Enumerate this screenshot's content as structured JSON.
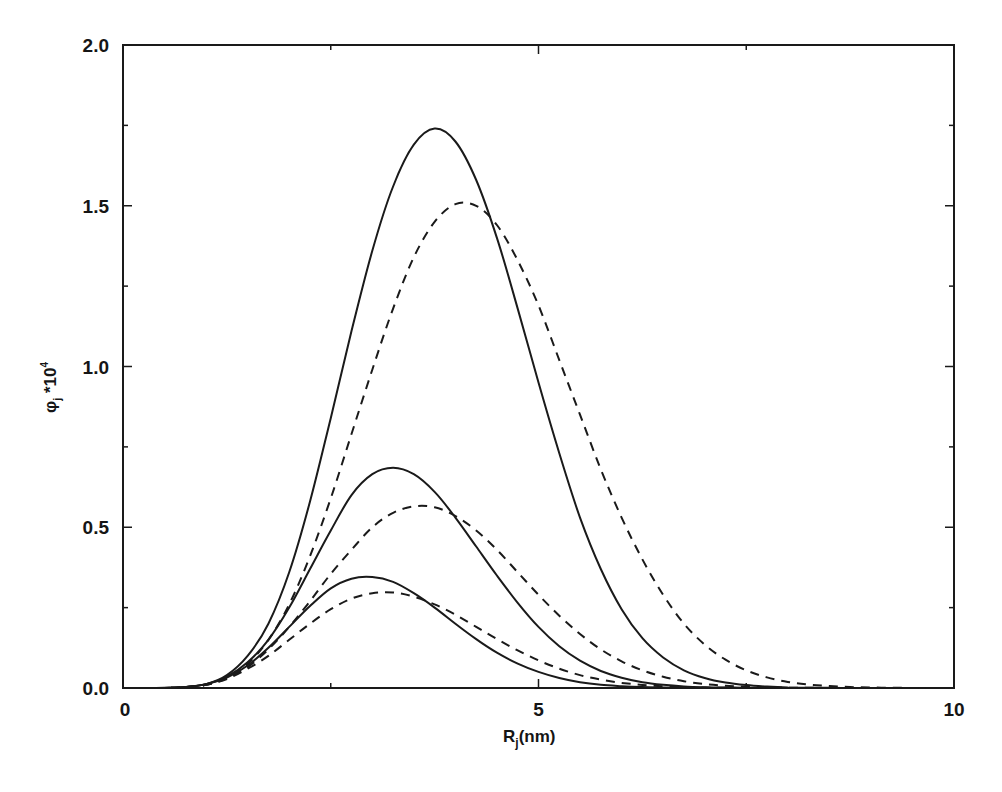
{
  "chart_data": {
    "type": "line",
    "title": "",
    "xlabel": "R_j(nm)",
    "ylabel": "φ_j *10^4",
    "xlim": [
      0,
      10
    ],
    "ylim": [
      0,
      2.0
    ],
    "xticks": [
      0,
      5,
      10
    ],
    "xtick_labels": [
      "0",
      "5",
      "10"
    ],
    "yticks": [
      0.0,
      0.5,
      1.0,
      1.5,
      2.0
    ],
    "ytick_labels": [
      "0.0",
      "0.5",
      "1.0",
      "1.5",
      "2.0"
    ],
    "grid": false,
    "legend": null,
    "x": [
      0,
      0.25,
      0.5,
      0.75,
      1.0,
      1.25,
      1.5,
      1.75,
      2.0,
      2.25,
      2.5,
      2.75,
      3.0,
      3.25,
      3.5,
      3.75,
      4.0,
      4.25,
      4.5,
      4.75,
      5.0,
      5.25,
      5.5,
      5.75,
      6.0,
      6.25,
      6.5,
      6.75,
      7.0,
      7.25,
      7.5,
      7.75,
      8.0,
      8.25,
      8.5,
      8.75,
      9.0,
      9.25,
      9.5,
      9.75,
      10.0
    ],
    "series": [
      {
        "name": "large-solid",
        "style": "solid",
        "peak_x": 3.75,
        "peak_y": 1.74,
        "values": [
          0,
          0,
          0.0005,
          0.003,
          0.012,
          0.04,
          0.1,
          0.2,
          0.36,
          0.58,
          0.84,
          1.11,
          1.36,
          1.56,
          1.69,
          1.74,
          1.7,
          1.58,
          1.4,
          1.18,
          0.95,
          0.73,
          0.53,
          0.37,
          0.245,
          0.155,
          0.095,
          0.055,
          0.031,
          0.017,
          0.009,
          0.0045,
          0.002,
          0.001,
          0.0005,
          0,
          0,
          0,
          0,
          0,
          0
        ]
      },
      {
        "name": "large-dashed",
        "style": "dashed",
        "peak_x": 4.15,
        "peak_y": 1.51,
        "values": [
          0,
          0,
          0.0004,
          0.0025,
          0.01,
          0.032,
          0.075,
          0.15,
          0.26,
          0.41,
          0.59,
          0.79,
          0.99,
          1.18,
          1.34,
          1.45,
          1.505,
          1.5,
          1.44,
          1.33,
          1.19,
          1.02,
          0.85,
          0.68,
          0.53,
          0.4,
          0.29,
          0.2,
          0.135,
          0.088,
          0.055,
          0.033,
          0.019,
          0.011,
          0.006,
          0.003,
          0.0015,
          0.0007,
          0.0003,
          0,
          0
        ]
      },
      {
        "name": "medium-solid",
        "style": "solid",
        "peak_x": 3.3,
        "peak_y": 0.685,
        "values": [
          0,
          0,
          0.0004,
          0.003,
          0.012,
          0.035,
          0.08,
          0.15,
          0.25,
          0.37,
          0.49,
          0.6,
          0.665,
          0.685,
          0.665,
          0.61,
          0.53,
          0.44,
          0.35,
          0.265,
          0.19,
          0.13,
          0.085,
          0.053,
          0.032,
          0.018,
          0.01,
          0.005,
          0.0025,
          0.0012,
          0.0005,
          0,
          0,
          0,
          0,
          0,
          0,
          0,
          0,
          0,
          0
        ]
      },
      {
        "name": "medium-dashed",
        "style": "dashed",
        "peak_x": 3.6,
        "peak_y": 0.565,
        "values": [
          0,
          0,
          0.0004,
          0.0025,
          0.01,
          0.03,
          0.065,
          0.12,
          0.19,
          0.27,
          0.355,
          0.43,
          0.5,
          0.545,
          0.565,
          0.562,
          0.535,
          0.49,
          0.43,
          0.36,
          0.29,
          0.225,
          0.168,
          0.12,
          0.083,
          0.055,
          0.035,
          0.021,
          0.012,
          0.007,
          0.0038,
          0.002,
          0.001,
          0.0005,
          0,
          0,
          0,
          0,
          0,
          0,
          0
        ]
      },
      {
        "name": "small-solid",
        "style": "solid",
        "peak_x": 2.97,
        "peak_y": 0.345,
        "values": [
          0,
          0,
          0.0004,
          0.003,
          0.012,
          0.032,
          0.07,
          0.125,
          0.19,
          0.255,
          0.31,
          0.34,
          0.345,
          0.33,
          0.295,
          0.25,
          0.2,
          0.152,
          0.11,
          0.076,
          0.05,
          0.031,
          0.018,
          0.01,
          0.0055,
          0.0028,
          0.0013,
          0.0006,
          0,
          0,
          0,
          0,
          0,
          0,
          0,
          0,
          0,
          0,
          0,
          0,
          0
        ]
      },
      {
        "name": "small-dashed",
        "style": "dashed",
        "peak_x": 3.2,
        "peak_y": 0.297,
        "values": [
          0,
          0,
          0.0004,
          0.0025,
          0.01,
          0.028,
          0.06,
          0.1,
          0.15,
          0.2,
          0.245,
          0.278,
          0.295,
          0.297,
          0.284,
          0.26,
          0.228,
          0.19,
          0.152,
          0.117,
          0.086,
          0.06,
          0.04,
          0.026,
          0.016,
          0.0095,
          0.0053,
          0.0028,
          0.0014,
          0.0007,
          0.0003,
          0,
          0,
          0,
          0,
          0,
          0,
          0,
          0,
          0,
          0
        ]
      }
    ]
  },
  "axes": {
    "y_title_main": "φ",
    "y_title_sub": "j",
    "y_title_rest": " *10",
    "y_title_sup": "4",
    "x_title_main": "R",
    "x_title_sub": "j",
    "x_title_rest": "(nm)"
  },
  "colors": {
    "line": "#1a1a1a",
    "axis": "#1a1a1a",
    "background": "#ffffff"
  }
}
